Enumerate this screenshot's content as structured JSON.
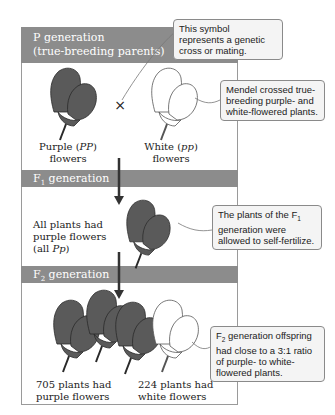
{
  "bands": {
    "p_line1": "P generation",
    "p_line2": "(true-breeding parents)",
    "f1_prefix": "F",
    "f1_sub": "1",
    "f1_suffix": " generation",
    "f2_prefix": "F",
    "f2_sub": "2",
    "f2_suffix": " generation"
  },
  "p_generation": {
    "purple_label_line1_a": "Purple (",
    "purple_label_line1_b": "PP",
    "purple_label_line1_c": ")",
    "purple_label_line2": "flowers",
    "white_label_line1_a": "White (",
    "white_label_line1_b": "pp",
    "white_label_line1_c": ")",
    "white_label_line2": "flowers",
    "cross_symbol": "×"
  },
  "f1_generation": {
    "label_line1": "All plants had",
    "label_line2": "purple flowers",
    "label_line3_a": "(all ",
    "label_line3_b": "Pp",
    "label_line3_c": ")"
  },
  "f2_generation": {
    "purple_line1": "705 plants had",
    "purple_line2": "purple flowers",
    "white_line1": "224 plants had",
    "white_line2": "white flowers"
  },
  "callouts": {
    "cross": "This symbol represents a genetic cross or mating.",
    "mendel": "Mendel crossed true-breeding purple- and white-flowered plants.",
    "f1_a": "The plants of the F",
    "f1_sub": "1",
    "f1_b": " generation were allowed to self-fertilize.",
    "f2_a": "F",
    "f2_sub": "2",
    "f2_b": " generation offspring had close to a 3:1 ratio of purple- to white-flowered plants."
  },
  "colors": {
    "band": "#8c8c8c",
    "purple_flower": "#5a5a5a",
    "white_flower": "#ffffff",
    "callout_bg": "#f4f4f4"
  }
}
